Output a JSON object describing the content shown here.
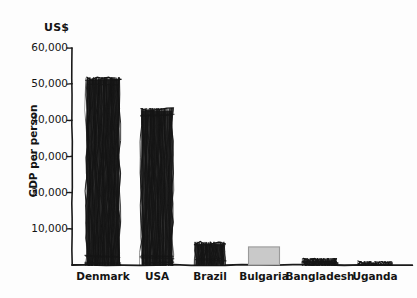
{
  "chart_data": {
    "type": "bar",
    "title": "",
    "subtitle": "",
    "unit_label": "US$",
    "xlabel": "",
    "ylabel": "GDP per person",
    "categories": [
      "Denmark",
      "USA",
      "Brazil",
      "Bulgaria",
      "Bangladesh",
      "Uganda"
    ],
    "values": [
      51500,
      43000,
      6000,
      5000,
      1500,
      700
    ],
    "ylim": [
      0,
      60000
    ],
    "ytick_values": [
      10000,
      20000,
      30000,
      40000,
      50000,
      60000
    ],
    "ytick_labels": [
      "10,000",
      "20,000",
      "30,000",
      "40,000",
      "50,000",
      "60,000"
    ],
    "grid": false,
    "legend": null,
    "bar_styles": [
      "sketch-black",
      "sketch-black",
      "sketch-black",
      "flat-gray",
      "sketch-black",
      "sketch-black"
    ],
    "style": "hand-drawn sketch",
    "colors": {
      "background": "#fdfdfd",
      "ink": "#1a1a1a",
      "bar_black": "#151515",
      "bar_gray_fill": "#c9c9c9",
      "bar_gray_stroke": "#9a9a9a",
      "axis": "#1a1a1a"
    }
  }
}
